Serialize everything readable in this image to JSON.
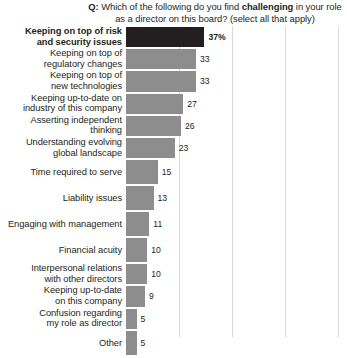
{
  "chart_data": {
    "type": "bar",
    "orientation": "horizontal",
    "title": "Q: Which of the following do you find challenging in your role as a director on this board? (select all that apply)",
    "title_parts": {
      "q_prefix": "Q:",
      "before_emph": " Which of the following do you find ",
      "emph": "challenging",
      "after_emph": " in your role as a director on this board? (select all that apply)"
    },
    "xlabel": "",
    "ylabel": "",
    "xlim": [
      0,
      100
    ],
    "grid": true,
    "grid_axis": "x",
    "gridline_values": [
      25,
      50,
      75,
      100
    ],
    "legend": "none",
    "value_suffix_first": "%",
    "categories": [
      "Keeping on top of risk and security issues",
      "Keeping on top of regulatory changes",
      "Keeping on top of new technologies",
      "Keeping up-to-date on industry of this company",
      "Asserting independent thinking",
      "Understanding evolving global landscape",
      "Time required to serve",
      "Liability issues",
      "Engaging with management",
      "Financial acuity",
      "Interpersonal relations with other directors",
      "Keeping up-to-date on this company",
      "Confusion regarding my role as director",
      "Other"
    ],
    "values": [
      37,
      33,
      33,
      27,
      26,
      23,
      15,
      13,
      11,
      10,
      10,
      9,
      5,
      5
    ],
    "value_labels": [
      "37%",
      "33",
      "33",
      "27",
      "26",
      "23",
      "15",
      "13",
      "11",
      "10",
      "10",
      "9",
      "5",
      "5"
    ],
    "bars": [
      {
        "label_lines": [
          "Keeping on top of risk",
          "and security issues"
        ],
        "value": 37,
        "value_label": "37%",
        "bold": true,
        "color": "#231f20"
      },
      {
        "label_lines": [
          "Keeping on top of",
          "regulatory changes"
        ],
        "value": 33,
        "value_label": "33",
        "bold": false,
        "color": "#8d8d8d"
      },
      {
        "label_lines": [
          "Keeping on top of",
          "new technologies"
        ],
        "value": 33,
        "value_label": "33",
        "bold": false,
        "color": "#8d8d8d"
      },
      {
        "label_lines": [
          "Keeping up-to-date on",
          "industry of this company"
        ],
        "value": 27,
        "value_label": "27",
        "bold": false,
        "color": "#8d8d8d"
      },
      {
        "label_lines": [
          "Asserting independent",
          "thinking"
        ],
        "value": 26,
        "value_label": "26",
        "bold": false,
        "color": "#8d8d8d"
      },
      {
        "label_lines": [
          "Understanding evolving",
          "global landscape"
        ],
        "value": 23,
        "value_label": "23",
        "bold": false,
        "color": "#8d8d8d"
      },
      {
        "label_lines": [
          "Time required to serve"
        ],
        "value": 15,
        "value_label": "15",
        "bold": false,
        "color": "#8d8d8d"
      },
      {
        "label_lines": [
          "Liability issues"
        ],
        "value": 13,
        "value_label": "13",
        "bold": false,
        "color": "#8d8d8d"
      },
      {
        "label_lines": [
          "Engaging with management"
        ],
        "value": 11,
        "value_label": "11",
        "bold": false,
        "color": "#8d8d8d"
      },
      {
        "label_lines": [
          "Financial acuity"
        ],
        "value": 10,
        "value_label": "10",
        "bold": false,
        "color": "#8d8d8d"
      },
      {
        "label_lines": [
          "Interpersonal relations",
          "with other directors"
        ],
        "value": 10,
        "value_label": "10",
        "bold": false,
        "color": "#8d8d8d"
      },
      {
        "label_lines": [
          "Keeping up-to-date",
          "on this company"
        ],
        "value": 9,
        "value_label": "9",
        "bold": false,
        "color": "#8d8d8d"
      },
      {
        "label_lines": [
          "Confusion regarding",
          "my role as director"
        ],
        "value": 5,
        "value_label": "5",
        "bold": false,
        "color": "#8d8d8d"
      },
      {
        "label_lines": [
          "Other"
        ],
        "value": 5,
        "value_label": "5",
        "bold": false,
        "color": "#8d8d8d"
      }
    ]
  },
  "colors": {
    "highlight_bar": "#231f20",
    "bar": "#8d8d8d",
    "gridline": "#d9d9d9",
    "text": "#231f20",
    "background": "#ffffff"
  }
}
